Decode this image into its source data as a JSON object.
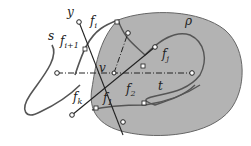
{
  "diagram": {
    "type": "geometric-figure",
    "region_label": "ρ",
    "vertex_label": "v",
    "labels": {
      "y": "y",
      "s": "s",
      "t": "t",
      "rho": "ρ",
      "v": "v",
      "fi": "f",
      "fi_sub": "i",
      "fi1": "f",
      "fi1_sub": "i+1",
      "fj": "f",
      "fj_sub": "j",
      "fk": "f",
      "fk_sub": "k",
      "f1": "f",
      "f1_sub": "1",
      "f2": "f",
      "f2_sub": "2"
    },
    "colors": {
      "region_fill": "#b3b3b3",
      "region_stroke": "#666666",
      "curve": "#555555",
      "line": "#222222",
      "background": "#ffffff"
    }
  }
}
